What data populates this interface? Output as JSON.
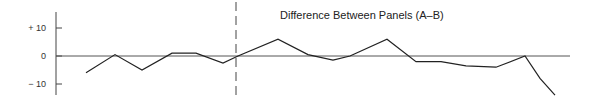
{
  "chart_data": {
    "type": "line",
    "title": "Difference Between Panels (A–B)",
    "xlabel": "",
    "ylabel": "",
    "ylim": [
      -15,
      15
    ],
    "yticks": [
      {
        "value": 10,
        "label": "+ 10"
      },
      {
        "value": 0,
        "label": "0"
      },
      {
        "value": -10,
        "label": "− 10"
      }
    ],
    "grid": false,
    "zero_line": true,
    "divider_x_index": 6,
    "series": [
      {
        "name": "Difference (A–B)",
        "x": [
          0,
          1,
          2,
          3,
          4,
          5,
          6,
          7,
          8,
          9,
          10,
          11,
          12,
          13,
          14,
          15,
          16,
          17,
          18
        ],
        "values": [
          -6,
          0.5,
          -5,
          1,
          1,
          -2.5,
          0,
          6,
          0.5,
          -1.5,
          0,
          6,
          -2,
          -2,
          -3.5,
          -4,
          0,
          -8,
          -14
        ]
      }
    ]
  },
  "layout": {
    "px_x": [
      86,
      115,
      142,
      172,
      196,
      223,
      238,
      278,
      308,
      333,
      350,
      387,
      416,
      441,
      466,
      496,
      525,
      540,
      555
    ],
    "axis_x": 56,
    "zero_y": 56,
    "px_per_unit": 2.8,
    "divider_px_x": 236,
    "zero_line_end_x": 570
  },
  "colors": {
    "line": "#222222",
    "axis": "#444444",
    "zero_line": "#555555"
  }
}
